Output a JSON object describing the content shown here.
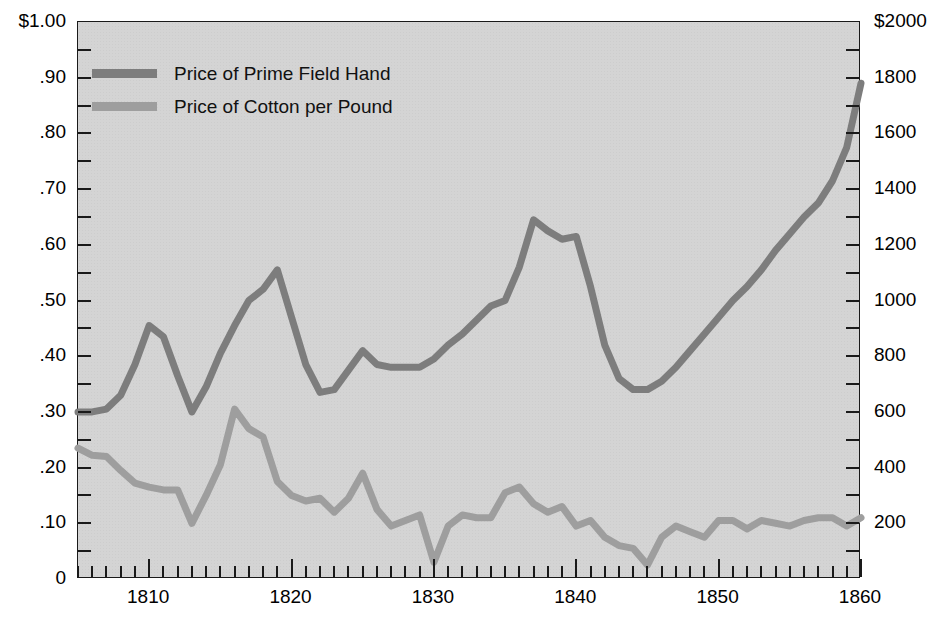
{
  "chart_data": {
    "type": "line",
    "title": "",
    "xlabel": "",
    "ylabel_left": "Price of Cotton per Pound (dollars)",
    "ylabel_right": "Price of Prime Field Hand (dollars)",
    "grid": false,
    "legend_position": "top-left",
    "xlim": [
      1805,
      1860
    ],
    "x_major_ticks": [
      1810,
      1820,
      1830,
      1840,
      1850,
      1860
    ],
    "x_tick_labels": [
      "1810",
      "1820",
      "1830",
      "1840",
      "1850",
      "1860"
    ],
    "x_minor_tick_interval": 1,
    "left_axis": {
      "lim": [
        0,
        1.0
      ],
      "ticks": [
        1.0,
        0.9,
        0.8,
        0.7,
        0.6,
        0.5,
        0.4,
        0.3,
        0.2,
        0.1,
        0.0
      ],
      "tick_labels": [
        "$1.00",
        ".90",
        ".80",
        ".70",
        ".60",
        ".50",
        ".40",
        ".30",
        ".20",
        ".10",
        "0"
      ],
      "minor_ticks": [
        0.95,
        0.85,
        0.75,
        0.65,
        0.55,
        0.45,
        0.35,
        0.25,
        0.15,
        0.05
      ]
    },
    "right_axis": {
      "lim": [
        0,
        2000
      ],
      "ticks": [
        2000,
        1800,
        1600,
        1400,
        1200,
        1000,
        800,
        600,
        400,
        200
      ],
      "tick_labels": [
        "$2000",
        "1800",
        "1600",
        "1400",
        "1200",
        "1000",
        "800",
        "600",
        "400",
        "200"
      ],
      "minor_ticks": [
        1900,
        1700,
        1500,
        1300,
        1100,
        900,
        700,
        500,
        300,
        100
      ]
    },
    "x": [
      1805,
      1806,
      1807,
      1808,
      1809,
      1810,
      1811,
      1812,
      1813,
      1814,
      1815,
      1816,
      1817,
      1818,
      1819,
      1820,
      1821,
      1822,
      1823,
      1824,
      1825,
      1826,
      1827,
      1828,
      1829,
      1830,
      1831,
      1832,
      1833,
      1834,
      1835,
      1836,
      1837,
      1838,
      1839,
      1840,
      1841,
      1842,
      1843,
      1844,
      1845,
      1846,
      1847,
      1848,
      1849,
      1850,
      1851,
      1852,
      1853,
      1854,
      1855,
      1856,
      1857,
      1858,
      1859,
      1860
    ],
    "series": [
      {
        "name": "Price of Prime Field Hand",
        "color": "#7d7d7d",
        "axis": "right",
        "unit": "dollars",
        "values_left_scale": [
          0.3,
          0.3,
          0.305,
          0.33,
          0.385,
          0.455,
          0.435,
          0.365,
          0.3,
          0.345,
          0.405,
          0.455,
          0.5,
          0.52,
          0.555,
          0.47,
          0.385,
          0.335,
          0.34,
          0.375,
          0.41,
          0.385,
          0.38,
          0.38,
          0.38,
          0.395,
          0.42,
          0.44,
          0.465,
          0.49,
          0.5,
          0.56,
          0.645,
          0.625,
          0.61,
          0.615,
          0.525,
          0.42,
          0.36,
          0.34,
          0.34,
          0.355,
          0.38,
          0.41,
          0.44,
          0.47,
          0.5,
          0.525,
          0.555,
          0.59,
          0.62,
          0.65,
          0.675,
          0.715,
          0.775,
          0.89
        ],
        "values": [
          600,
          600,
          610,
          660,
          770,
          910,
          870,
          730,
          600,
          690,
          810,
          910,
          1000,
          1040,
          1110,
          940,
          770,
          670,
          680,
          750,
          820,
          770,
          760,
          760,
          760,
          790,
          840,
          880,
          930,
          980,
          1000,
          1120,
          1290,
          1250,
          1220,
          1230,
          1050,
          840,
          720,
          680,
          680,
          710,
          760,
          820,
          880,
          940,
          1000,
          1050,
          1110,
          1180,
          1240,
          1300,
          1350,
          1430,
          1550,
          1780
        ]
      },
      {
        "name": "Price of Cotton per Pound",
        "color": "#9e9e9e",
        "axis": "left",
        "unit": "dollars",
        "values": [
          0.235,
          0.222,
          0.22,
          0.195,
          0.172,
          0.165,
          0.16,
          0.16,
          0.1,
          0.15,
          0.205,
          0.305,
          0.27,
          0.255,
          0.175,
          0.15,
          0.14,
          0.145,
          0.12,
          0.145,
          0.19,
          0.125,
          0.095,
          0.105,
          0.115,
          0.03,
          0.095,
          0.115,
          0.11,
          0.11,
          0.155,
          0.165,
          0.135,
          0.12,
          0.13,
          0.095,
          0.105,
          0.075,
          0.06,
          0.055,
          0.025,
          0.075,
          0.095,
          0.085,
          0.075,
          0.105,
          0.105,
          0.09,
          0.105,
          0.1,
          0.095,
          0.105,
          0.11,
          0.11,
          0.095,
          0.11
        ]
      }
    ]
  },
  "legend": {
    "items": [
      {
        "label": "Price of Prime Field Hand",
        "color": "#7d7d7d"
      },
      {
        "label": "Price of Cotton per Pound",
        "color": "#9e9e9e"
      }
    ]
  }
}
